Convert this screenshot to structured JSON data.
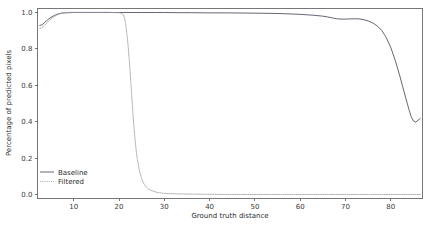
{
  "chart_data": {
    "type": "line",
    "title": "",
    "xlabel": "Ground truth distance",
    "ylabel": "Percentage of predicted pixels",
    "xlim": [
      2,
      87
    ],
    "ylim": [
      -0.02,
      1.02
    ],
    "xticks": [
      "10",
      "20",
      "30",
      "40",
      "50",
      "60",
      "70",
      "80"
    ],
    "xtick_values": [
      10,
      20,
      30,
      40,
      50,
      60,
      70,
      80
    ],
    "yticks": [
      "0.0",
      "0.2",
      "0.4",
      "0.6",
      "0.8",
      "1.0"
    ],
    "ytick_values": [
      0.0,
      0.2,
      0.4,
      0.6,
      0.8,
      1.0
    ],
    "grid": false,
    "legend_position": "lower-left",
    "series": [
      {
        "name": "Baseline",
        "color": "#4a4a5a",
        "linestyle": "solid",
        "x": [
          2.5,
          3,
          3.5,
          4,
          4.5,
          5,
          5.5,
          6,
          6.5,
          7,
          7.5,
          8,
          9,
          10,
          12,
          15,
          18,
          20,
          22,
          25,
          28,
          30,
          33,
          36,
          40,
          44,
          48,
          52,
          56,
          60,
          63,
          65,
          66,
          67,
          68,
          69,
          70,
          71,
          72,
          73,
          74,
          75,
          76,
          77,
          78,
          79,
          80,
          81,
          82,
          83,
          84,
          84.5,
          85,
          85.5,
          86,
          86.5
        ],
        "y": [
          0.927,
          0.931,
          0.942,
          0.953,
          0.963,
          0.972,
          0.979,
          0.985,
          0.99,
          0.993,
          0.995,
          0.996,
          0.997,
          0.998,
          0.998,
          0.998,
          0.998,
          0.998,
          0.998,
          0.998,
          0.998,
          0.998,
          0.997,
          0.997,
          0.996,
          0.996,
          0.995,
          0.994,
          0.992,
          0.988,
          0.983,
          0.978,
          0.974,
          0.969,
          0.964,
          0.962,
          0.962,
          0.963,
          0.964,
          0.963,
          0.959,
          0.952,
          0.941,
          0.925,
          0.9,
          0.861,
          0.806,
          0.735,
          0.65,
          0.558,
          0.468,
          0.428,
          0.404,
          0.398,
          0.408,
          0.418
        ]
      },
      {
        "name": "Filtered",
        "color": "#9aa0a8",
        "linestyle": "dotted",
        "x": [
          2.5,
          3,
          3.5,
          4,
          4.5,
          5,
          5.5,
          6,
          6.5,
          7,
          7.5,
          8,
          8.5,
          9,
          10,
          11,
          12,
          14,
          16,
          18,
          19,
          20,
          20.5,
          21,
          21.3,
          21.6,
          22,
          22.4,
          22.8,
          23.2,
          23.6,
          24,
          24.5,
          25,
          25.5,
          26,
          26.5,
          27,
          28,
          29,
          30,
          33,
          36,
          40,
          45,
          50,
          55,
          60,
          65,
          70,
          75,
          80,
          84,
          86.5
        ],
        "y": [
          0.912,
          0.915,
          0.927,
          0.94,
          0.952,
          0.963,
          0.972,
          0.98,
          0.987,
          0.992,
          0.995,
          0.997,
          0.998,
          0.999,
          0.999,
          0.999,
          0.999,
          0.999,
          0.999,
          0.999,
          0.998,
          0.997,
          0.994,
          0.985,
          0.96,
          0.91,
          0.82,
          0.69,
          0.545,
          0.4,
          0.285,
          0.2,
          0.132,
          0.088,
          0.06,
          0.043,
          0.032,
          0.025,
          0.016,
          0.011,
          0.008,
          0.005,
          0.004,
          0.003,
          0.002,
          0.002,
          0.002,
          0.002,
          0.002,
          0.002,
          0.002,
          0.002,
          0.002,
          0.002
        ]
      }
    ]
  },
  "legend": {
    "entries": [
      {
        "label": "Baseline"
      },
      {
        "label": "Filtered"
      }
    ]
  }
}
